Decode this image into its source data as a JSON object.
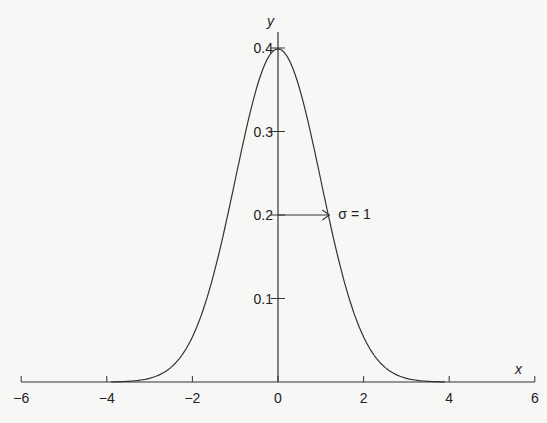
{
  "chart_data": {
    "type": "line",
    "title": "",
    "xlabel": "x",
    "ylabel": "y",
    "xlim": [
      -6,
      6
    ],
    "ylim": [
      0,
      0.4
    ],
    "x_ticks": [
      -6,
      -4,
      -2,
      0,
      2,
      4,
      6
    ],
    "x_tick_labels": [
      "−6",
      "−4",
      "−2",
      "0",
      "2",
      "4",
      "6"
    ],
    "y_ticks": [
      0.1,
      0.2,
      0.3,
      0.4
    ],
    "y_tick_labels": [
      "0.1",
      "0.2",
      "0.3",
      "0.4"
    ],
    "grid": false,
    "legend": null,
    "series": [
      {
        "name": "Standard normal density",
        "mean": 0,
        "sigma": 1,
        "x": [
          -6,
          -4,
          -3,
          -2,
          -1,
          0,
          1,
          2,
          3,
          4,
          6
        ],
        "y": [
          0.0,
          0.0001,
          0.0044,
          0.054,
          0.242,
          0.399,
          0.242,
          0.054,
          0.0044,
          0.0001,
          0.0
        ]
      }
    ],
    "annotations": [
      {
        "text": "σ = 1",
        "type": "arrow",
        "from": [
          0,
          0.2
        ],
        "to": [
          1.2,
          0.2
        ]
      }
    ]
  }
}
